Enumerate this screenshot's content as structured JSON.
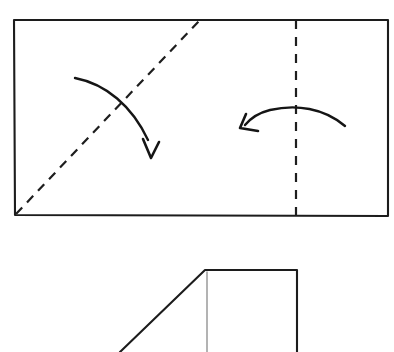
{
  "figure": {
    "kind": "origami-fold-instruction",
    "canvas": {
      "width": 394,
      "height": 352
    },
    "background_color": "#ffffff",
    "ink_color": "#1c1c1c",
    "ghost_color": "#9a9a9a"
  },
  "top_shape": {
    "name": "unfolded-rectangle",
    "label": "Unfolded rectangular sheet",
    "corners": {
      "top_left": [
        14,
        20
      ],
      "top_right": [
        388,
        20
      ],
      "bottom_right": [
        388,
        216
      ],
      "bottom_left": [
        15,
        215
      ]
    },
    "path": "M14,20 L388,20 L388,216 L15,215 Z",
    "stroke_color": "#1c1c1c",
    "stroke_width": 2.1
  },
  "fold_lines": [
    {
      "name": "diagonal-fold-line",
      "label": "Diagonal valley fold",
      "style": "dashed",
      "from": [
        16,
        214
      ],
      "to": [
        199,
        21
      ],
      "dash_pattern": "9 7",
      "stroke_color": "#1e1e1e"
    },
    {
      "name": "vertical-fold-line",
      "label": "Vertical valley fold",
      "style": "dashed",
      "from": [
        296,
        20
      ],
      "to": [
        296,
        215
      ],
      "dash_pattern": "9 8",
      "stroke_color": "#1e1e1e"
    }
  ],
  "arrows": [
    {
      "name": "fold-arrow-diagonal",
      "label": "Fold down across the diagonal",
      "direction": "down-right",
      "start": [
        75,
        78
      ],
      "end": [
        152,
        157
      ],
      "curve_path": "M75,78 C106,84 132,106 148,140",
      "head_path": "M143,139 L151,158 L159,142",
      "stroke_color": "#151515"
    },
    {
      "name": "fold-arrow-vertical",
      "label": "Fold left across the vertical line",
      "direction": "left",
      "start": [
        345,
        126
      ],
      "end": [
        240,
        128
      ],
      "curve_path": "M345,126 C324,108 296,104 270,110 C258,113 250,119 245,125",
      "head_path": "M246,114 L240,128 L258,131",
      "stroke_color": "#151515"
    }
  ],
  "bottom_shape": {
    "name": "folded-result",
    "label": "Resulting folded shape (partially shown)",
    "outline_path": "M120,352 L205,270 L297,270 L297,352",
    "ghost_line": {
      "name": "hidden-edge-ghost",
      "label": "Hidden edge behind fold",
      "from": [
        207,
        272
      ],
      "to": [
        207,
        352
      ],
      "stroke_color": "#9a9a9a"
    },
    "corners": {
      "top_left": [
        205,
        270
      ],
      "top_right": [
        297,
        270
      ],
      "diagonal_bottom": [
        120,
        352
      ]
    },
    "cropped_at_bottom": true
  }
}
